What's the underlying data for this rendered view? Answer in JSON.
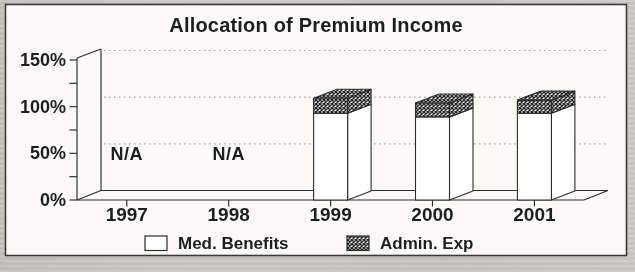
{
  "chart_data": {
    "type": "bar",
    "variant": "3d-stacked-percent",
    "title": "Allocation of Premium Income",
    "categories": [
      "1997",
      "1998",
      "1999",
      "2000",
      "2001"
    ],
    "series": [
      {
        "name": "Med. Benefits",
        "swatch": "white",
        "values": [
          null,
          null,
          93,
          89,
          93
        ]
      },
      {
        "name": "Admin. Exp",
        "swatch": "crosshatch",
        "values": [
          null,
          null,
          16,
          15,
          14
        ]
      }
    ],
    "na_text": "N/A",
    "ylim": [
      0,
      150
    ],
    "ytick_labels": [
      "0%",
      "50%",
      "100%",
      "150%"
    ],
    "ytick_values": [
      0,
      50,
      100,
      150
    ],
    "minor_tick_step": 25,
    "gridlines": {
      "values": [
        50,
        100,
        150
      ],
      "style": "dotted"
    },
    "legend": {
      "position": "bottom",
      "entries": [
        "Med. Benefits",
        "Admin. Exp"
      ]
    },
    "colors": {
      "ink": "#2c2c2c",
      "surface": "#fbfaf7",
      "page_background": "#cbc8c1",
      "gridline": "#a3a39e",
      "bar_fill": "#ffffff",
      "hatch_ink": "#232323"
    }
  }
}
